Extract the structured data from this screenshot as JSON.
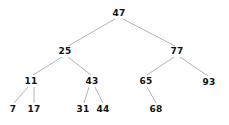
{
  "figure": {
    "type": "binary-search-tree",
    "width": 229,
    "height": 125,
    "background_color": "#ffffff",
    "edge_color": "#a0a0a0",
    "edge_width": 0.8,
    "label_color": "#111111"
  },
  "nodes": [
    {
      "id": "n47",
      "label": "47",
      "x": 119,
      "y": 13,
      "depth": 0
    },
    {
      "id": "n25",
      "label": "25",
      "x": 65,
      "y": 51,
      "depth": 1
    },
    {
      "id": "n77",
      "label": "77",
      "x": 177,
      "y": 51,
      "depth": 1
    },
    {
      "id": "n11",
      "label": "11",
      "x": 31,
      "y": 81,
      "depth": 2
    },
    {
      "id": "n43",
      "label": "43",
      "x": 92,
      "y": 81,
      "depth": 2
    },
    {
      "id": "n65",
      "label": "65",
      "x": 146,
      "y": 81,
      "depth": 2
    },
    {
      "id": "n93",
      "label": "93",
      "x": 209,
      "y": 82,
      "depth": 2
    },
    {
      "id": "n7",
      "label": "7",
      "x": 13,
      "y": 109,
      "depth": 3
    },
    {
      "id": "n17",
      "label": "17",
      "x": 34,
      "y": 109,
      "depth": 3
    },
    {
      "id": "n31",
      "label": "31",
      "x": 83,
      "y": 109,
      "depth": 3
    },
    {
      "id": "n44",
      "label": "44",
      "x": 103,
      "y": 109,
      "depth": 3
    },
    {
      "id": "n68",
      "label": "68",
      "x": 156,
      "y": 109,
      "depth": 3
    }
  ],
  "edges": [
    {
      "from": "n47",
      "to": "n25",
      "side": "left",
      "x1": 115,
      "y1": 19,
      "x2": 68,
      "y2": 46
    },
    {
      "from": "n47",
      "to": "n77",
      "side": "right",
      "x1": 123,
      "y1": 19,
      "x2": 175,
      "y2": 46
    },
    {
      "from": "n25",
      "to": "n11",
      "side": "left",
      "x1": 62,
      "y1": 57,
      "x2": 33,
      "y2": 75
    },
    {
      "from": "n25",
      "to": "n43",
      "side": "right",
      "x1": 68,
      "y1": 57,
      "x2": 91,
      "y2": 75
    },
    {
      "from": "n77",
      "to": "n65",
      "side": "left",
      "x1": 174,
      "y1": 57,
      "x2": 147,
      "y2": 75
    },
    {
      "from": "n77",
      "to": "n93",
      "side": "right",
      "x1": 180,
      "y1": 57,
      "x2": 208,
      "y2": 76
    },
    {
      "from": "n11",
      "to": "n7",
      "side": "left",
      "x1": 28,
      "y1": 87,
      "x2": 14,
      "y2": 103
    },
    {
      "from": "n11",
      "to": "n17",
      "side": "right",
      "x1": 34,
      "y1": 87,
      "x2": 34,
      "y2": 103
    },
    {
      "from": "n43",
      "to": "n31",
      "side": "left",
      "x1": 89,
      "y1": 87,
      "x2": 84,
      "y2": 103
    },
    {
      "from": "n43",
      "to": "n44",
      "side": "right",
      "x1": 95,
      "y1": 87,
      "x2": 103,
      "y2": 103
    },
    {
      "from": "n65",
      "to": "n68",
      "side": "right",
      "x1": 147,
      "y1": 87,
      "x2": 156,
      "y2": 103
    }
  ]
}
